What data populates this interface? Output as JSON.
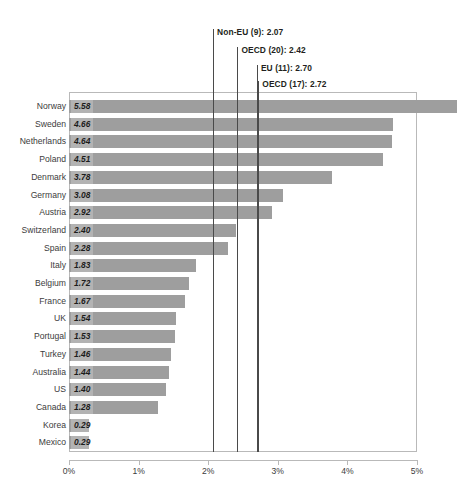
{
  "chart_data": {
    "type": "bar",
    "orientation": "horizontal",
    "title": "",
    "subtitle": "",
    "xlabel": "",
    "ylabel": "",
    "xlim": [
      0,
      5
    ],
    "grid": false,
    "legend": "none",
    "value_format": "percent",
    "categories": [
      "Norway",
      "Sweden",
      "Netherlands",
      "Poland",
      "Denmark",
      "Germany",
      "Austria",
      "Switzerland",
      "Spain",
      "Italy",
      "Belgium",
      "France",
      "UK",
      "Portugal",
      "Turkey",
      "Australia",
      "US",
      "Canada",
      "Korea",
      "Mexico"
    ],
    "values": [
      5.58,
      4.66,
      4.64,
      4.51,
      3.78,
      3.08,
      2.92,
      2.4,
      2.28,
      1.83,
      1.72,
      1.67,
      1.54,
      1.53,
      1.46,
      1.44,
      1.4,
      1.28,
      0.29,
      0.29
    ],
    "value_labels": [
      "5.58",
      "4.66",
      "4.64",
      "4.51",
      "3.78",
      "3.08",
      "2.92",
      "2.40",
      "2.28",
      "1.83",
      "1.72",
      "1.67",
      "1.54",
      "1.53",
      "1.46",
      "1.44",
      "1.40",
      "1.28",
      "0.29",
      "0.29"
    ],
    "xticks": [
      0,
      1,
      2,
      3,
      4,
      5
    ],
    "xtick_labels": [
      "0%",
      "1%",
      "2%",
      "3%",
      "4%",
      "5%"
    ],
    "reference_lines": [
      {
        "label": "Non-EU (9): 2.07",
        "value": 2.07
      },
      {
        "label": "OECD (20): 2.42",
        "value": 2.42
      },
      {
        "label": "EU (11): 2.70",
        "value": 2.7
      },
      {
        "label": "OECD (17): 2.72",
        "value": 2.72
      }
    ],
    "colors": {
      "bar": "#9e9e9e",
      "reference_line": "#4a4a4a",
      "frame": "#b9b9b9",
      "text": "#3c3c3c",
      "value_text": "#1c1c1c",
      "background": "#ffffff"
    }
  }
}
